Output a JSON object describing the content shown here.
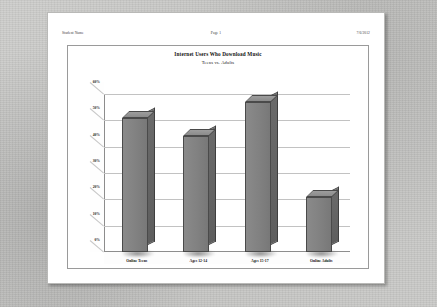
{
  "page_header": {
    "left": "Student Name",
    "center": "Page 1",
    "right": "7/6/2012"
  },
  "chart_data": {
    "type": "bar",
    "title": "Internet Users Who Download Music",
    "subtitle": "Teens vs. Adults",
    "xlabel": "",
    "ylabel": "",
    "categories": [
      "Online Teens",
      "Ages 12-14",
      "Ages 15-17",
      "Online Adults"
    ],
    "values": [
      51,
      44,
      57,
      21
    ],
    "yticks": [
      "0%",
      "10%",
      "20%",
      "30%",
      "40%",
      "50%",
      "60%"
    ],
    "ytick_values": [
      0,
      10,
      20,
      30,
      40,
      50,
      60
    ],
    "ylim": [
      0,
      60
    ],
    "grid": true,
    "legend": "none",
    "style": "3d-column",
    "bar_color": "#808080",
    "bar_side_color": "#636363",
    "bar_border_color": "#4a4a4a",
    "gridline_color": "#c2c2c2",
    "plot_background": "#ffffff",
    "frame_border_color": "#9a9a9a"
  },
  "colors": {
    "page": "#ffffff",
    "desktop": "#c8c8c6",
    "text": "#111111"
  }
}
